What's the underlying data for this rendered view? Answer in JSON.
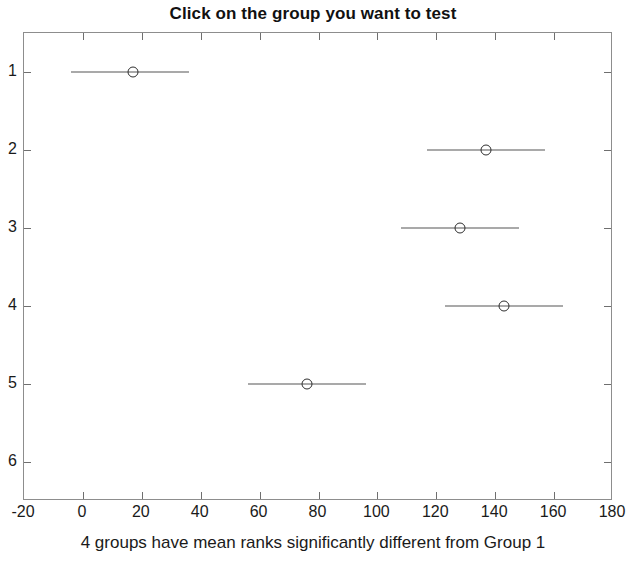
{
  "chart_data": {
    "type": "scatter",
    "title": "Click on the group you want to test",
    "caption": "4 groups have mean ranks significantly different from Group 1",
    "xlabel": "",
    "ylabel": "",
    "xlim": [
      -20,
      180
    ],
    "ylim": [
      0.5,
      6.5
    ],
    "xticks": [
      -20,
      0,
      20,
      40,
      60,
      80,
      100,
      120,
      140,
      160,
      180
    ],
    "xtick_labels": [
      "-20",
      "0",
      "20",
      "40",
      "60",
      "80",
      "100",
      "120",
      "140",
      "160",
      "180"
    ],
    "yticks": [
      1,
      2,
      3,
      4,
      5,
      6
    ],
    "ytick_labels": [
      "1",
      "2",
      "3",
      "4",
      "5",
      "6"
    ],
    "y_inverted": true,
    "grid": false,
    "legend": null,
    "marker_style": "open-circle",
    "line_color": "#555555",
    "marker_color": "#2e2e2e",
    "axis_color": "#8d8d8d",
    "series": [
      {
        "name": "Group 1",
        "group": 1,
        "mean_rank": 17,
        "ci_low": -4,
        "ci_high": 36,
        "visible": true
      },
      {
        "name": "Group 2",
        "group": 2,
        "mean_rank": 137,
        "ci_low": 117,
        "ci_high": 157,
        "visible": true
      },
      {
        "name": "Group 3",
        "group": 3,
        "mean_rank": 128,
        "ci_low": 108,
        "ci_high": 148,
        "visible": true
      },
      {
        "name": "Group 4",
        "group": 4,
        "mean_rank": 143,
        "ci_low": 123,
        "ci_high": 163,
        "visible": true
      },
      {
        "name": "Group 5",
        "group": 5,
        "mean_rank": 76,
        "ci_low": 56,
        "ci_high": 96,
        "visible": true
      },
      {
        "name": "Group 6",
        "group": 6,
        "mean_rank": null,
        "ci_low": null,
        "ci_high": null,
        "visible": false
      }
    ]
  }
}
